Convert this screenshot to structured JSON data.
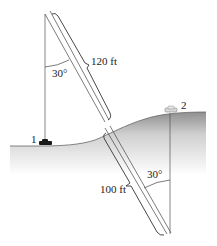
{
  "diagram": {
    "labels": {
      "upper_length": "120 ft",
      "lower_length": "100 ft",
      "upper_angle": "30°",
      "lower_angle": "30°",
      "point1": "1",
      "point2": "2"
    },
    "colors": {
      "line": "#333333",
      "ground_top": "#9a9a9a",
      "ground_bottom": "#ffffff"
    }
  }
}
